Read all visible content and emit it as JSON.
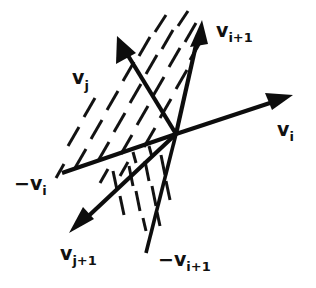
{
  "figure": {
    "background_color": "#ffffff",
    "ink_color": "#0d0d0d",
    "origin": {
      "x": 176,
      "y": 134
    },
    "labels": {
      "v_i": "v",
      "v_i_sub": "i",
      "v_i_plus_1": "v",
      "v_i_plus_1_sub": "i+1",
      "neg_v_i": "−v",
      "neg_v_i_sub": "i",
      "neg_v_i_plus_1": "−v",
      "neg_v_i_plus_1_sub": "i+1",
      "v_j": "v",
      "v_j_sub": "j",
      "v_j_plus_1": "v",
      "v_j_plus_1_sub": "j+1"
    },
    "vectors": [
      {
        "name": "v_i",
        "from": [
          176,
          134
        ],
        "to": [
          293,
          95
        ],
        "arrow": true,
        "label": "v_i"
      },
      {
        "name": "neg_v_i",
        "from": [
          176,
          134
        ],
        "to": [
          62,
          173
        ],
        "arrow": false,
        "label": "-v_i"
      },
      {
        "name": "v_i_plus_1",
        "from": [
          176,
          134
        ],
        "to": [
          202,
          20
        ],
        "arrow": true,
        "label": "v_i+1"
      },
      {
        "name": "neg_v_i_plus_1",
        "from": [
          176,
          134
        ],
        "to": [
          146,
          253
        ],
        "arrow": false,
        "label": "-v_i+1"
      },
      {
        "name": "v_j",
        "from": [
          176,
          134
        ],
        "to": [
          117,
          36
        ],
        "arrow": true,
        "label": "v_j"
      },
      {
        "name": "v_j_plus_1",
        "from": [
          176,
          134
        ],
        "to": [
          69,
          233
        ],
        "arrow": true,
        "label": "v_j+1"
      }
    ],
    "hatched_regions": [
      {
        "name": "upper-wedge",
        "between": [
          "neg_v_i",
          "v_i_plus_1"
        ],
        "dash_angle_deg": 62
      },
      {
        "name": "lower-wedge",
        "between": [
          "v_j_plus_1",
          "neg_v_i_plus_1"
        ],
        "dash_angle_deg": 80
      }
    ]
  }
}
